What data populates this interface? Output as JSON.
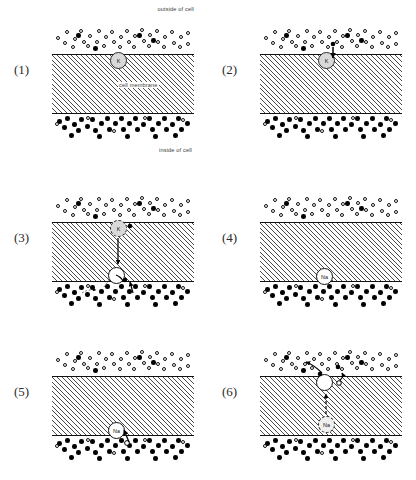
{
  "figure": {
    "panel_count": 6
  },
  "labels": {
    "outside": "outside of cell",
    "membrane": "cell membrane",
    "inside": "inside of cell",
    "k_ion": "K",
    "na_ion": "Na"
  },
  "colors": {
    "ink": "#111111",
    "hatch": "#4a4a4a",
    "k_channel_fill": "#d9d9d9",
    "na_channel_fill": "#ffffff",
    "background": "#ffffff"
  },
  "panels": [
    {
      "number": "(1)",
      "caption_outside": "outside of cell",
      "caption_membrane": "cell membrane",
      "caption_inside": "inside of cell",
      "transporter": {
        "label": "K",
        "style": "k",
        "position": "membrane-top"
      },
      "arrows": [],
      "show_captions": true
    },
    {
      "number": "(2)",
      "transporter": {
        "label": "K",
        "style": "k",
        "position": "membrane-top"
      },
      "arrows": [
        {
          "from": "outside",
          "to": "transporter",
          "direction": "down"
        }
      ],
      "show_captions": false
    },
    {
      "number": "(3)",
      "transporter": {
        "label": "K",
        "style": "k-dashed",
        "position": "membrane-top"
      },
      "transporter2": {
        "label": "",
        "style": "plain",
        "position": "membrane-bottom"
      },
      "arrows": [
        {
          "from": "k-site",
          "to": "lower-site",
          "direction": "down"
        },
        {
          "from": "inside",
          "to": "lower-site",
          "direction": "up"
        }
      ],
      "show_captions": false
    },
    {
      "number": "(4)",
      "transporter": {
        "label": "Na",
        "style": "na",
        "position": "membrane-bottom"
      },
      "arrows": [],
      "show_captions": false
    },
    {
      "number": "(5)",
      "transporter": {
        "label": "Na",
        "style": "na",
        "position": "membrane-bottom"
      },
      "arrows": [
        {
          "from": "inside",
          "to": "transporter",
          "direction": "up"
        }
      ],
      "show_captions": false
    },
    {
      "number": "(6)",
      "transporter": {
        "label": "",
        "style": "plain",
        "position": "membrane-top"
      },
      "transporter2": {
        "label": "Na",
        "style": "na-dashed",
        "position": "membrane-mid"
      },
      "arrows": [
        {
          "from": "na-site",
          "to": "upper-site",
          "direction": "up"
        },
        {
          "from": "upper-site",
          "to": "outside",
          "direction": "up-left"
        }
      ],
      "show_captions": false
    }
  ],
  "ion_fields": {
    "outside_description": "predominantly open circles with a few filled circles",
    "inside_description": "predominantly filled circles with a few open circles",
    "outside": [
      {
        "x": 4,
        "y": 20,
        "t": "open"
      },
      {
        "x": 13,
        "y": 14,
        "t": "open"
      },
      {
        "x": 21,
        "y": 21,
        "t": "open"
      },
      {
        "x": 11,
        "y": 25,
        "t": "open"
      },
      {
        "x": 27,
        "y": 13,
        "t": "open"
      },
      {
        "x": 30,
        "y": 24,
        "t": "open"
      },
      {
        "x": 36,
        "y": 18,
        "t": "open"
      },
      {
        "x": 19,
        "y": 29,
        "t": "open"
      },
      {
        "x": 34,
        "y": 28,
        "t": "open"
      },
      {
        "x": 43,
        "y": 24,
        "t": "open"
      },
      {
        "x": 45,
        "y": 13,
        "t": "open"
      },
      {
        "x": 52,
        "y": 19,
        "t": "open"
      },
      {
        "x": 50,
        "y": 28,
        "t": "open"
      },
      {
        "x": 58,
        "y": 14,
        "t": "open"
      },
      {
        "x": 60,
        "y": 24,
        "t": "open"
      },
      {
        "x": 67,
        "y": 19,
        "t": "open"
      },
      {
        "x": 66,
        "y": 29,
        "t": "open"
      },
      {
        "x": 73,
        "y": 13,
        "t": "open"
      },
      {
        "x": 75,
        "y": 24,
        "t": "open"
      },
      {
        "x": 81,
        "y": 18,
        "t": "open"
      },
      {
        "x": 80,
        "y": 29,
        "t": "open"
      },
      {
        "x": 88,
        "y": 12,
        "t": "open"
      },
      {
        "x": 90,
        "y": 23,
        "t": "open"
      },
      {
        "x": 96,
        "y": 17,
        "t": "open"
      },
      {
        "x": 95,
        "y": 28,
        "t": "open"
      },
      {
        "x": 103,
        "y": 13,
        "t": "open"
      },
      {
        "x": 104,
        "y": 24,
        "t": "open"
      },
      {
        "x": 111,
        "y": 19,
        "t": "open"
      },
      {
        "x": 110,
        "y": 29,
        "t": "open"
      },
      {
        "x": 118,
        "y": 14,
        "t": "open"
      },
      {
        "x": 120,
        "y": 25,
        "t": "open"
      },
      {
        "x": 127,
        "y": 19,
        "t": "open"
      },
      {
        "x": 126,
        "y": 29,
        "t": "open"
      },
      {
        "x": 134,
        "y": 15,
        "t": "open"
      },
      {
        "x": 134,
        "y": 26,
        "t": "open"
      },
      {
        "x": 24,
        "y": 17,
        "t": "filled"
      },
      {
        "x": 41,
        "y": 30,
        "t": "filled"
      },
      {
        "x": 85,
        "y": 17,
        "t": "filled"
      },
      {
        "x": 99,
        "y": 22,
        "t": "filled"
      }
    ],
    "inside": [
      {
        "x": 5,
        "y": 6,
        "t": "filled"
      },
      {
        "x": 13,
        "y": 3,
        "t": "filled"
      },
      {
        "x": 10,
        "y": 12,
        "t": "filled"
      },
      {
        "x": 20,
        "y": 9,
        "t": "filled"
      },
      {
        "x": 27,
        "y": 4,
        "t": "filled"
      },
      {
        "x": 24,
        "y": 15,
        "t": "filled"
      },
      {
        "x": 33,
        "y": 11,
        "t": "filled"
      },
      {
        "x": 38,
        "y": 4,
        "t": "filled"
      },
      {
        "x": 41,
        "y": 15,
        "t": "filled"
      },
      {
        "x": 47,
        "y": 8,
        "t": "filled"
      },
      {
        "x": 53,
        "y": 3,
        "t": "filled"
      },
      {
        "x": 55,
        "y": 14,
        "t": "filled"
      },
      {
        "x": 61,
        "y": 8,
        "t": "filled"
      },
      {
        "x": 67,
        "y": 3,
        "t": "filled"
      },
      {
        "x": 69,
        "y": 14,
        "t": "filled"
      },
      {
        "x": 75,
        "y": 8,
        "t": "filled"
      },
      {
        "x": 81,
        "y": 3,
        "t": "filled"
      },
      {
        "x": 83,
        "y": 14,
        "t": "filled"
      },
      {
        "x": 89,
        "y": 9,
        "t": "filled"
      },
      {
        "x": 95,
        "y": 3,
        "t": "filled"
      },
      {
        "x": 98,
        "y": 14,
        "t": "filled"
      },
      {
        "x": 104,
        "y": 8,
        "t": "filled"
      },
      {
        "x": 110,
        "y": 3,
        "t": "filled"
      },
      {
        "x": 112,
        "y": 14,
        "t": "filled"
      },
      {
        "x": 118,
        "y": 9,
        "t": "filled"
      },
      {
        "x": 124,
        "y": 3,
        "t": "filled"
      },
      {
        "x": 127,
        "y": 14,
        "t": "filled"
      },
      {
        "x": 133,
        "y": 8,
        "t": "filled"
      },
      {
        "x": 17,
        "y": 20,
        "t": "filled"
      },
      {
        "x": 45,
        "y": 21,
        "t": "filled"
      },
      {
        "x": 73,
        "y": 21,
        "t": "filled"
      },
      {
        "x": 101,
        "y": 21,
        "t": "filled"
      },
      {
        "x": 121,
        "y": 20,
        "t": "filled"
      },
      {
        "x": 3,
        "y": 9,
        "t": "open"
      },
      {
        "x": 34,
        "y": 3,
        "t": "open"
      },
      {
        "x": 60,
        "y": 16,
        "t": "open"
      },
      {
        "x": 91,
        "y": 3,
        "t": "open"
      },
      {
        "x": 129,
        "y": 5,
        "t": "open"
      }
    ]
  }
}
